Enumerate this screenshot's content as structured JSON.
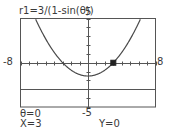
{
  "screen": {
    "equation": "r1=3/(1-sin(θ))",
    "window": {
      "xmin": "-8",
      "xmax": "8",
      "ymin": "-5",
      "ymax": "5"
    },
    "cursor": {
      "theta": "θ=0",
      "x": "X=3",
      "y": "Y=0"
    }
  },
  "chart_data": {
    "type": "line",
    "title": "r1=3/(1-sin(θ))",
    "xlim": [
      -8,
      8
    ],
    "ylim": [
      -5,
      5
    ],
    "xtick_step": 1,
    "ytick_step": 1,
    "series": [
      {
        "name": "r1 (parabola x^2 = 9 + 6y)",
        "x": [
          -6.2,
          -5,
          -4,
          -3,
          -2,
          -1,
          0,
          1,
          2,
          3,
          4,
          5,
          6.2
        ],
        "y": [
          4.91,
          2.67,
          1.17,
          0,
          -0.83,
          -1.33,
          -1.5,
          -1.33,
          -0.83,
          0,
          1.17,
          2.67,
          4.91
        ]
      },
      {
        "name": "directrix",
        "x": [
          -8,
          8
        ],
        "y": [
          -3,
          -3
        ]
      }
    ],
    "trace_point": {
      "theta": 0,
      "x": 3,
      "y": 0
    }
  }
}
